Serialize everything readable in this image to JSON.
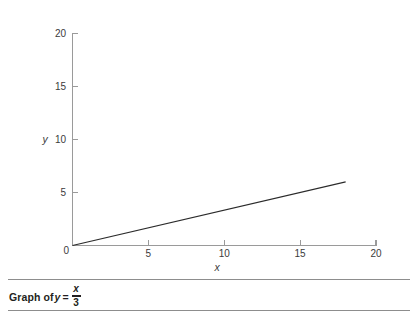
{
  "chart_data": {
    "type": "line",
    "title": "",
    "xlabel": "x",
    "ylabel": "y",
    "xlim": [
      0,
      20
    ],
    "ylim": [
      0,
      20
    ],
    "grid": false,
    "legend": null,
    "equation": "y = x/3",
    "x_ticks": [
      0,
      5,
      10,
      15,
      20
    ],
    "y_ticks": [
      0,
      5,
      10,
      15,
      20
    ],
    "x_tick_labels": [
      "0",
      "5",
      "10",
      "15",
      "20"
    ],
    "y_tick_labels": [
      "0",
      "5",
      "10",
      "15",
      "20"
    ],
    "series": [
      {
        "name": "y = x/3",
        "color": "#2b2b2b",
        "x": [
          0,
          18
        ],
        "y": [
          0,
          6
        ]
      }
    ]
  },
  "caption": {
    "prefix": "Graph of",
    "variable": "y",
    "equals": "=",
    "numerator": "x",
    "denominator": "3"
  },
  "colors": {
    "axis": "#9a9a9a",
    "data_line": "#2b2b2b",
    "text": "#231f20",
    "rule": "#8d8d8d",
    "background": "#ffffff"
  }
}
